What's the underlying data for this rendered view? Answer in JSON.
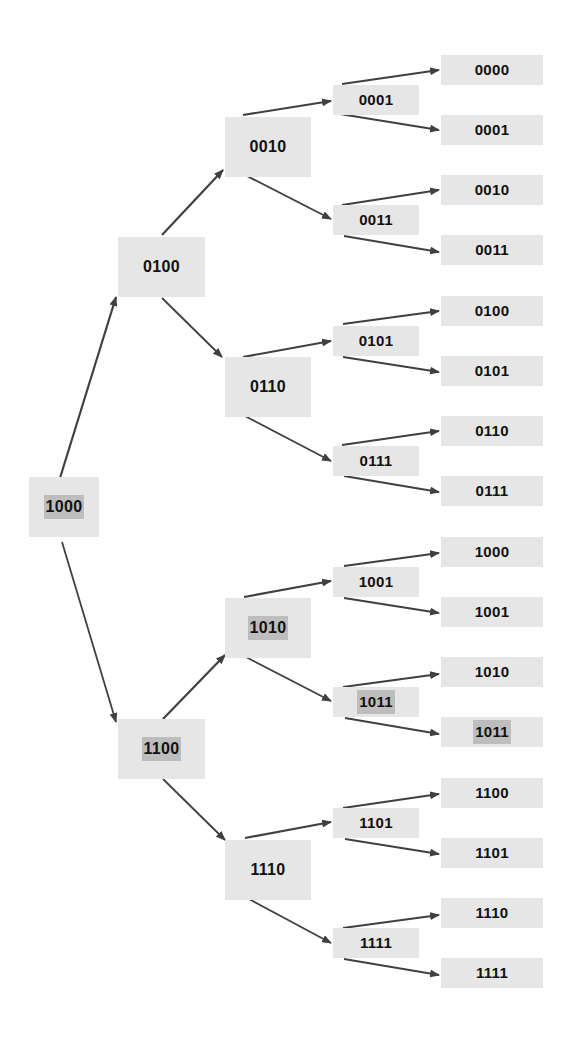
{
  "diagram": {
    "type": "binary-tree",
    "colors": {
      "node_fill": "#e6e6e6",
      "highlight_fill": "#bdbdbd",
      "arrow": "#404040",
      "text": "#111111"
    },
    "nodes": [
      {
        "id": "n1000",
        "label": "1000",
        "level": 1,
        "x": 29,
        "y": 477,
        "w": 70,
        "h": 60,
        "highlight": true
      },
      {
        "id": "n0100",
        "label": "0100",
        "level": 2,
        "x": 118,
        "y": 237,
        "w": 87,
        "h": 60,
        "highlight": false
      },
      {
        "id": "n1100",
        "label": "1100",
        "level": 2,
        "x": 118,
        "y": 719,
        "w": 87,
        "h": 60,
        "highlight": true
      },
      {
        "id": "n0010",
        "label": "0010",
        "level": 3,
        "x": 225,
        "y": 117,
        "w": 86,
        "h": 60,
        "highlight": false
      },
      {
        "id": "n0110",
        "label": "0110",
        "level": 3,
        "x": 225,
        "y": 357,
        "w": 86,
        "h": 60,
        "highlight": false
      },
      {
        "id": "n1010",
        "label": "1010",
        "level": 3,
        "x": 225,
        "y": 598,
        "w": 86,
        "h": 60,
        "highlight": true
      },
      {
        "id": "n1110",
        "label": "1110",
        "level": 3,
        "x": 225,
        "y": 840,
        "w": 86,
        "h": 60,
        "highlight": false
      },
      {
        "id": "n0001",
        "label": "0001",
        "level": 4,
        "x": 333,
        "y": 85,
        "w": 86,
        "h": 30,
        "highlight": false
      },
      {
        "id": "n0011",
        "label": "0011",
        "level": 4,
        "x": 333,
        "y": 205,
        "w": 86,
        "h": 30,
        "highlight": false
      },
      {
        "id": "n0101",
        "label": "0101",
        "level": 4,
        "x": 333,
        "y": 326,
        "w": 86,
        "h": 30,
        "highlight": false
      },
      {
        "id": "n0111",
        "label": "0111",
        "level": 4,
        "x": 333,
        "y": 446,
        "w": 86,
        "h": 30,
        "highlight": false
      },
      {
        "id": "n1001",
        "label": "1001",
        "level": 4,
        "x": 333,
        "y": 567,
        "w": 86,
        "h": 30,
        "highlight": false
      },
      {
        "id": "n1011",
        "label": "1011",
        "level": 4,
        "x": 333,
        "y": 687,
        "w": 86,
        "h": 30,
        "highlight": true
      },
      {
        "id": "n1101",
        "label": "1101",
        "level": 4,
        "x": 333,
        "y": 808,
        "w": 86,
        "h": 30,
        "highlight": false
      },
      {
        "id": "n1111",
        "label": "1111",
        "level": 4,
        "x": 333,
        "y": 928,
        "w": 86,
        "h": 30,
        "highlight": false
      },
      {
        "id": "l0000",
        "label": "0000",
        "level": 5,
        "x": 441,
        "y": 55,
        "w": 102,
        "h": 30,
        "highlight": false
      },
      {
        "id": "l0001",
        "label": "0001",
        "level": 5,
        "x": 441,
        "y": 115,
        "w": 102,
        "h": 30,
        "highlight": false
      },
      {
        "id": "l0010",
        "label": "0010",
        "level": 5,
        "x": 441,
        "y": 175,
        "w": 102,
        "h": 30,
        "highlight": false
      },
      {
        "id": "l0011",
        "label": "0011",
        "level": 5,
        "x": 441,
        "y": 235,
        "w": 102,
        "h": 30,
        "highlight": false
      },
      {
        "id": "l0100",
        "label": "0100",
        "level": 5,
        "x": 441,
        "y": 296,
        "w": 102,
        "h": 30,
        "highlight": false
      },
      {
        "id": "l0101",
        "label": "0101",
        "level": 5,
        "x": 441,
        "y": 356,
        "w": 102,
        "h": 30,
        "highlight": false
      },
      {
        "id": "l0110",
        "label": "0110",
        "level": 5,
        "x": 441,
        "y": 416,
        "w": 102,
        "h": 30,
        "highlight": false
      },
      {
        "id": "l0111",
        "label": "0111",
        "level": 5,
        "x": 441,
        "y": 476,
        "w": 102,
        "h": 30,
        "highlight": false
      },
      {
        "id": "l1000",
        "label": "1000",
        "level": 5,
        "x": 441,
        "y": 537,
        "w": 102,
        "h": 30,
        "highlight": false
      },
      {
        "id": "l1001",
        "label": "1001",
        "level": 5,
        "x": 441,
        "y": 597,
        "w": 102,
        "h": 30,
        "highlight": false
      },
      {
        "id": "l1010",
        "label": "1010",
        "level": 5,
        "x": 441,
        "y": 657,
        "w": 102,
        "h": 30,
        "highlight": false
      },
      {
        "id": "l1011",
        "label": "1011",
        "level": 5,
        "x": 441,
        "y": 717,
        "w": 102,
        "h": 30,
        "highlight": true
      },
      {
        "id": "l1100",
        "label": "1100",
        "level": 5,
        "x": 441,
        "y": 778,
        "w": 102,
        "h": 30,
        "highlight": false
      },
      {
        "id": "l1101",
        "label": "1101",
        "level": 5,
        "x": 441,
        "y": 838,
        "w": 102,
        "h": 30,
        "highlight": false
      },
      {
        "id": "l1110",
        "label": "1110",
        "level": 5,
        "x": 441,
        "y": 898,
        "w": 102,
        "h": 30,
        "highlight": false
      },
      {
        "id": "l1111",
        "label": "1111",
        "level": 5,
        "x": 441,
        "y": 958,
        "w": 102,
        "h": 30,
        "highlight": false
      }
    ],
    "edges": [
      {
        "from": "n1000",
        "to": "n0100",
        "x1": 60,
        "y1": 478,
        "x2": 116,
        "y2": 297
      },
      {
        "from": "n1000",
        "to": "n1100",
        "x1": 62,
        "y1": 542,
        "x2": 116,
        "y2": 722
      },
      {
        "from": "n0100",
        "to": "n0010",
        "x1": 162,
        "y1": 235,
        "x2": 223,
        "y2": 170
      },
      {
        "from": "n0100",
        "to": "n0110",
        "x1": 162,
        "y1": 298,
        "x2": 222,
        "y2": 357
      },
      {
        "from": "n1100",
        "to": "n1010",
        "x1": 163,
        "y1": 719,
        "x2": 225,
        "y2": 655
      },
      {
        "from": "n1100",
        "to": "n1110",
        "x1": 163,
        "y1": 779,
        "x2": 225,
        "y2": 840
      },
      {
        "from": "n0010",
        "to": "n0001",
        "x1": 243,
        "y1": 115,
        "x2": 331,
        "y2": 101
      },
      {
        "from": "n0010",
        "to": "n0011",
        "x1": 245,
        "y1": 175,
        "x2": 331,
        "y2": 219
      },
      {
        "from": "n0110",
        "to": "n0101",
        "x1": 243,
        "y1": 357,
        "x2": 331,
        "y2": 341
      },
      {
        "from": "n0110",
        "to": "n0111",
        "x1": 243,
        "y1": 415,
        "x2": 331,
        "y2": 461
      },
      {
        "from": "n1010",
        "to": "n1001",
        "x1": 244,
        "y1": 597,
        "x2": 331,
        "y2": 581
      },
      {
        "from": "n1010",
        "to": "n1011",
        "x1": 244,
        "y1": 656,
        "x2": 331,
        "y2": 701
      },
      {
        "from": "n1110",
        "to": "n1101",
        "x1": 245,
        "y1": 838,
        "x2": 331,
        "y2": 822
      },
      {
        "from": "n1110",
        "to": "n1111",
        "x1": 247,
        "y1": 898,
        "x2": 331,
        "y2": 943
      },
      {
        "from": "n0001",
        "to": "l0000",
        "x1": 342,
        "y1": 84,
        "x2": 439,
        "y2": 70
      },
      {
        "from": "n0001",
        "to": "l0001",
        "x1": 340,
        "y1": 114,
        "x2": 439,
        "y2": 130
      },
      {
        "from": "n0011",
        "to": "l0010",
        "x1": 342,
        "y1": 205,
        "x2": 439,
        "y2": 190
      },
      {
        "from": "n0011",
        "to": "l0011",
        "x1": 344,
        "y1": 236,
        "x2": 439,
        "y2": 252
      },
      {
        "from": "n0101",
        "to": "l0100",
        "x1": 343,
        "y1": 324,
        "x2": 439,
        "y2": 311
      },
      {
        "from": "n0101",
        "to": "l0101",
        "x1": 343,
        "y1": 357,
        "x2": 439,
        "y2": 372
      },
      {
        "from": "n0111",
        "to": "l0110",
        "x1": 342,
        "y1": 445,
        "x2": 439,
        "y2": 431
      },
      {
        "from": "n0111",
        "to": "l0111",
        "x1": 344,
        "y1": 476,
        "x2": 439,
        "y2": 492
      },
      {
        "from": "n1001",
        "to": "l1000",
        "x1": 344,
        "y1": 566,
        "x2": 439,
        "y2": 553
      },
      {
        "from": "n1001",
        "to": "l1001",
        "x1": 344,
        "y1": 598,
        "x2": 439,
        "y2": 613
      },
      {
        "from": "n1011",
        "to": "l1010",
        "x1": 343,
        "y1": 687,
        "x2": 439,
        "y2": 674
      },
      {
        "from": "n1011",
        "to": "l1011",
        "x1": 345,
        "y1": 718,
        "x2": 439,
        "y2": 734
      },
      {
        "from": "n1101",
        "to": "l1100",
        "x1": 343,
        "y1": 808,
        "x2": 439,
        "y2": 794
      },
      {
        "from": "n1101",
        "to": "l1101",
        "x1": 345,
        "y1": 839,
        "x2": 439,
        "y2": 854
      },
      {
        "from": "n1111",
        "to": "l1110",
        "x1": 343,
        "y1": 928,
        "x2": 439,
        "y2": 915
      },
      {
        "from": "n1111",
        "to": "l1111",
        "x1": 344,
        "y1": 959,
        "x2": 439,
        "y2": 975
      }
    ]
  }
}
